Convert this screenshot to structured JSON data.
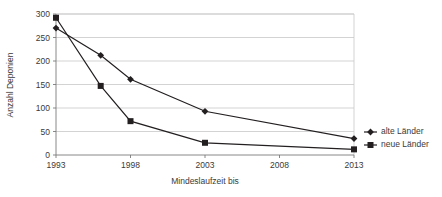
{
  "chart_data": {
    "type": "line",
    "title": "",
    "xlabel": "Mindeslaufzeit bis",
    "ylabel": "Anzahl Deponien",
    "x": [
      1993,
      1996,
      1998,
      2003,
      2013
    ],
    "xlim": [
      1993,
      2013
    ],
    "ylim": [
      0,
      300
    ],
    "xticks": [
      "1993",
      "1998",
      "2003",
      "2008",
      "2013"
    ],
    "xtick_values": [
      1993,
      1998,
      2003,
      2008,
      2013
    ],
    "yticks": [
      "0",
      "50",
      "100",
      "150",
      "200",
      "250",
      "300"
    ],
    "ytick_values": [
      0,
      50,
      100,
      150,
      200,
      250,
      300
    ],
    "grid": "horizontal",
    "legend_position": "right",
    "series": [
      {
        "name": "alte Länder",
        "marker": "diamond",
        "color": "#231f20",
        "values": [
          270,
          212,
          161,
          93,
          35
        ]
      },
      {
        "name": "neue Länder",
        "marker": "square",
        "color": "#231f20",
        "values": [
          292,
          147,
          72,
          26,
          12
        ]
      }
    ]
  },
  "legend": {
    "items": [
      {
        "label": "alte Länder",
        "marker": "diamond"
      },
      {
        "label": "neue Länder",
        "marker": "square"
      }
    ]
  },
  "colors": {
    "ink": "#231f20",
    "grid": "#c8c8c8",
    "axis": "#7a7a7a",
    "background": "#ffffff"
  }
}
